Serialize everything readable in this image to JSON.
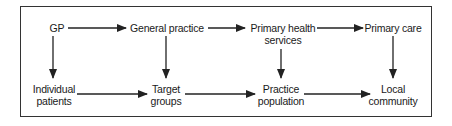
{
  "diagram": {
    "type": "flow",
    "top_row": [
      {
        "id": "gp",
        "lines": [
          "GP"
        ]
      },
      {
        "id": "general-practice",
        "lines": [
          "General practice"
        ]
      },
      {
        "id": "primary-health-services",
        "lines": [
          "Primary health",
          "services"
        ]
      },
      {
        "id": "primary-care",
        "lines": [
          "Primary care"
        ]
      }
    ],
    "bottom_row": [
      {
        "id": "individual-patients",
        "lines": [
          "Individual",
          "patients"
        ]
      },
      {
        "id": "target-groups",
        "lines": [
          "Target",
          "groups"
        ]
      },
      {
        "id": "practice-population",
        "lines": [
          "Practice",
          "population"
        ]
      },
      {
        "id": "local-community",
        "lines": [
          "Local",
          "community"
        ]
      }
    ],
    "edges": [
      {
        "from": "gp",
        "to": "general-practice"
      },
      {
        "from": "general-practice",
        "to": "primary-health-services"
      },
      {
        "from": "primary-health-services",
        "to": "primary-care"
      },
      {
        "from": "individual-patients",
        "to": "target-groups"
      },
      {
        "from": "target-groups",
        "to": "practice-population"
      },
      {
        "from": "practice-population",
        "to": "local-community"
      },
      {
        "from": "gp",
        "to": "individual-patients"
      },
      {
        "from": "general-practice",
        "to": "target-groups"
      },
      {
        "from": "primary-health-services",
        "to": "practice-population"
      },
      {
        "from": "primary-care",
        "to": "local-community"
      }
    ]
  }
}
